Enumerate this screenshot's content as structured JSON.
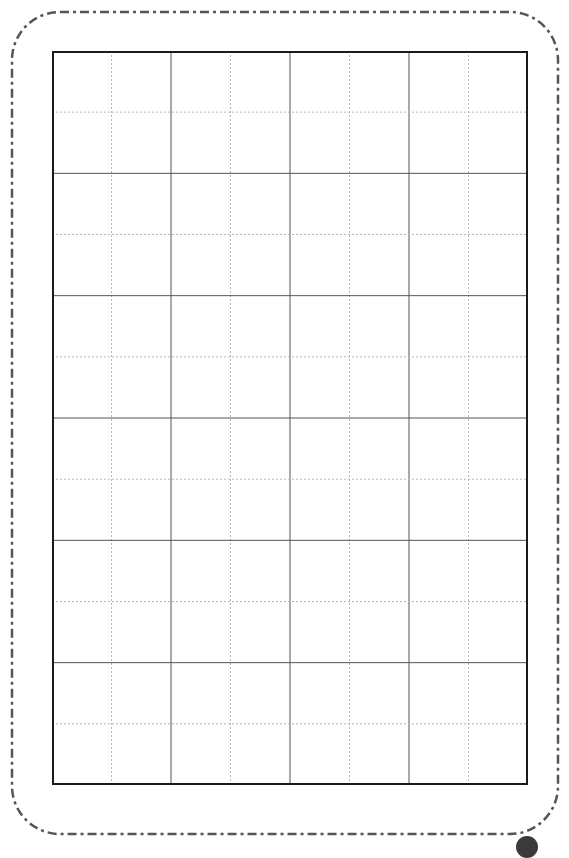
{
  "sheet": {
    "type": "writing-practice-grid",
    "columns": 8,
    "rows": 12,
    "major_every": 2,
    "colors": {
      "outer_border": "#1a1a1a",
      "major_line": "#555555",
      "minor_line": "#b5b5b5",
      "card_border": "#555555",
      "corner_mark": "#3a3a3a"
    }
  }
}
